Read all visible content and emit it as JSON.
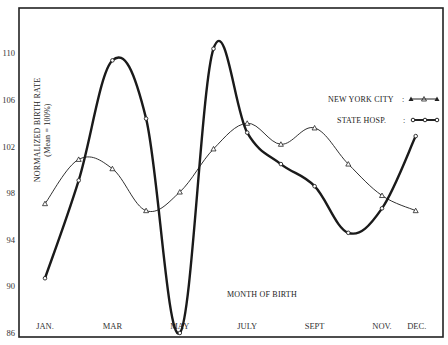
{
  "chart_data": {
    "type": "line",
    "title": "",
    "xlabel": "MONTH OF BIRTH",
    "ylabel": "NORMALIZED BIRTH RATE",
    "ylabel_sub": "(Mean = 100%)",
    "x_tick_labels": [
      "JAN.",
      "MAR",
      "MAY",
      "JULY",
      "SEPT",
      "NOV.",
      "DEC."
    ],
    "x_tick_months": [
      1,
      3,
      5,
      7,
      9,
      11,
      12
    ],
    "categories": [
      "JAN",
      "FEB",
      "MAR",
      "APR",
      "MAY",
      "JUN",
      "JUL",
      "AUG",
      "SEP",
      "OCT",
      "NOV",
      "DEC"
    ],
    "y_ticks": [
      86,
      90,
      94,
      98,
      102,
      106,
      110
    ],
    "ylim": [
      86,
      112
    ],
    "grid": false,
    "legend_position": "right, upper-middle",
    "series": [
      {
        "name": "NEW YORK CITY",
        "marker": "triangle",
        "line": "thin",
        "values": [
          97.1,
          100.9,
          100.1,
          96.5,
          98.1,
          101.8,
          104.0,
          102.2,
          103.6,
          100.5,
          97.8,
          96.5
        ]
      },
      {
        "name": "STATE HOSP.",
        "marker": "circle",
        "line": "thick",
        "values": [
          90.7,
          99.1,
          109.4,
          104.4,
          86.0,
          110.4,
          103.2,
          100.5,
          98.6,
          94.6,
          96.7,
          102.9
        ]
      }
    ]
  },
  "legend": {
    "nyc_label": "NEW YORK CITY",
    "nyc_sep": ":",
    "hosp_label": "STATE HOSP.",
    "hosp_sep": ":"
  },
  "axes": {
    "xlabel": "MONTH OF BIRTH",
    "ylabel": "NORMALIZED BIRTH RATE",
    "ylabel_sub": "(Mean = 100%)"
  }
}
